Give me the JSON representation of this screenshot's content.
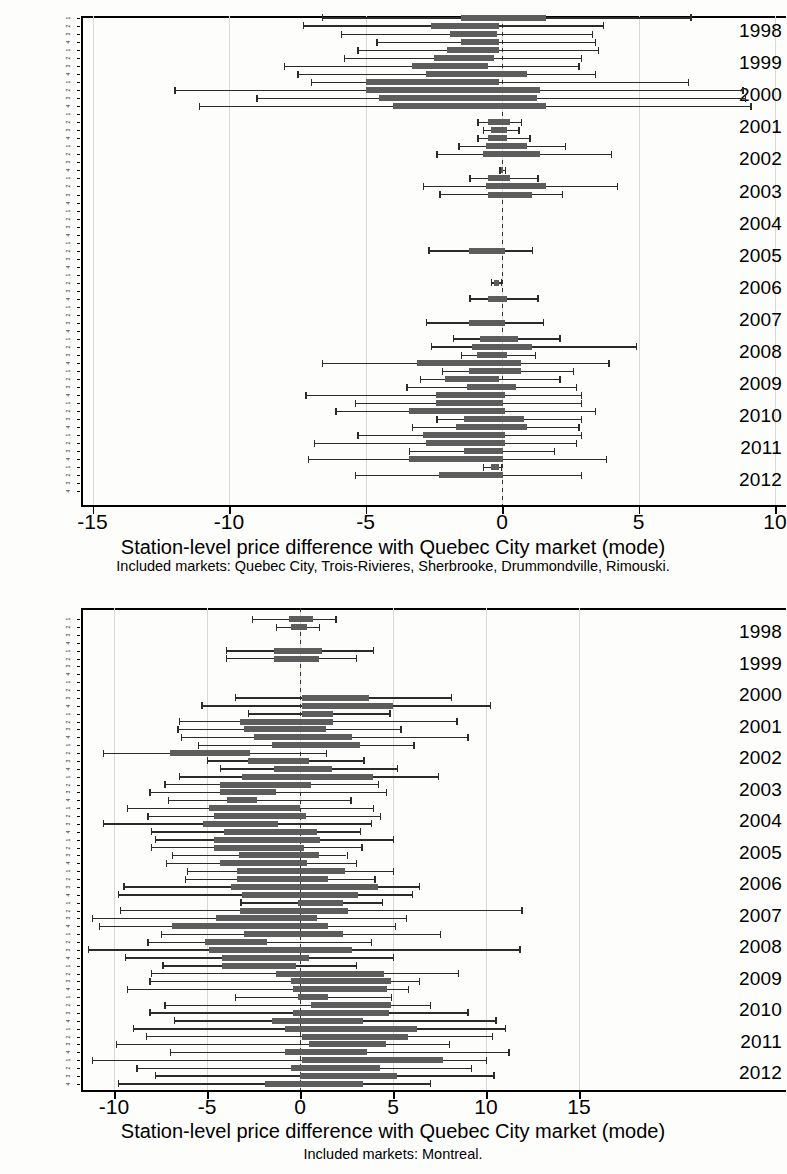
{
  "document": {
    "kind": "scanned-figure-page",
    "figure_count": 2
  },
  "chart_data": [
    {
      "type": "bar",
      "subtype": "horizontal-box-plot",
      "id": "chart-top",
      "title": "",
      "xlabel": "Station-level price difference with Quebec City market (mode)",
      "ylabel": "",
      "caption": "Included markets: Quebec City, Trois-Rivieres, Sherbrooke, Drummondville, Rimouski.",
      "xlim": [
        -16.0,
        10.6
      ],
      "xticks": [
        -15,
        -10,
        -5,
        0,
        5,
        10
      ],
      "xticklabels": [
        "-15",
        "-10",
        "-5",
        "0",
        "5",
        "10"
      ],
      "grid": true,
      "reference_line": 0,
      "legend": "none",
      "years": [
        "1998",
        "1999",
        "2000",
        "2001",
        "2002",
        "2003",
        "2004",
        "2005",
        "2006",
        "2007",
        "2008",
        "2009",
        "2010",
        "2011",
        "2012"
      ],
      "quarter_labels": [
        "1",
        "2",
        "3",
        "4"
      ],
      "boxes": [
        {
          "year": "1998",
          "q": 1,
          "low": -6.6,
          "q1": -1.5,
          "q3": 1.6,
          "high": 6.9
        },
        {
          "year": "1998",
          "q": 2,
          "low": -7.3,
          "q1": -2.6,
          "q3": -0.1,
          "high": 3.7
        },
        {
          "year": "1998",
          "q": 3,
          "low": -5.9,
          "q1": -1.9,
          "q3": -0.2,
          "high": 3.3
        },
        {
          "year": "1998",
          "q": 4,
          "low": -4.6,
          "q1": -1.5,
          "q3": -0.1,
          "high": 3.4
        },
        {
          "year": "1999",
          "q": 1,
          "low": -5.3,
          "q1": -2.0,
          "q3": -0.1,
          "high": 3.5
        },
        {
          "year": "1999",
          "q": 2,
          "low": -5.8,
          "q1": -2.5,
          "q3": -0.3,
          "high": 2.9
        },
        {
          "year": "1999",
          "q": 3,
          "low": -8.0,
          "q1": -3.3,
          "q3": -0.5,
          "high": 2.8
        },
        {
          "year": "1999",
          "q": 4,
          "low": -7.5,
          "q1": -2.8,
          "q3": 0.9,
          "high": 3.4
        },
        {
          "year": "2000",
          "q": 1,
          "low": -7.0,
          "q1": -5.0,
          "q3": -0.1,
          "high": 6.8
        },
        {
          "year": "2000",
          "q": 2,
          "low": -12.0,
          "q1": -5.0,
          "q3": 1.4,
          "high": 8.8
        },
        {
          "year": "2000",
          "q": 3,
          "low": -9.0,
          "q1": -4.5,
          "q3": 1.3,
          "high": 8.9
        },
        {
          "year": "2000",
          "q": 4,
          "low": -11.1,
          "q1": -4.0,
          "q3": 1.6,
          "high": 9.1
        },
        {
          "year": "2001",
          "q": 2,
          "low": -0.9,
          "q1": -0.5,
          "q3": 0.3,
          "high": 0.7
        },
        {
          "year": "2001",
          "q": 3,
          "low": -0.7,
          "q1": -0.4,
          "q3": 0.2,
          "high": 0.6
        },
        {
          "year": "2001",
          "q": 4,
          "low": -0.9,
          "q1": -0.5,
          "q3": 0.2,
          "high": 1.0
        },
        {
          "year": "2002",
          "q": 1,
          "low": -1.6,
          "q1": -0.6,
          "q3": 0.9,
          "high": 2.3
        },
        {
          "year": "2002",
          "q": 2,
          "low": -2.4,
          "q1": -0.7,
          "q3": 1.4,
          "high": 4.0
        },
        {
          "year": "2002",
          "q": 4,
          "low": -0.1,
          "q1": -0.05,
          "q3": 0.05,
          "high": 0.1
        },
        {
          "year": "2003",
          "q": 1,
          "low": -1.2,
          "q1": -0.5,
          "q3": 0.3,
          "high": 1.3
        },
        {
          "year": "2003",
          "q": 2,
          "low": -2.9,
          "q1": -0.6,
          "q3": 1.6,
          "high": 4.2
        },
        {
          "year": "2003",
          "q": 3,
          "low": -2.3,
          "q1": -0.5,
          "q3": 1.1,
          "high": 2.2
        },
        {
          "year": "2005",
          "q": 2,
          "low": -2.7,
          "q1": -1.2,
          "q3": 0.1,
          "high": 1.1
        },
        {
          "year": "2006",
          "q": 2,
          "low": -0.4,
          "q1": -0.3,
          "q3": -0.1,
          "high": -0.05
        },
        {
          "year": "2006",
          "q": 4,
          "low": -1.2,
          "q1": -0.5,
          "q3": 0.2,
          "high": 1.3
        },
        {
          "year": "2007",
          "q": 3,
          "low": -2.8,
          "q1": -1.2,
          "q3": 0.1,
          "high": 1.5
        },
        {
          "year": "2008",
          "q": 1,
          "low": -1.8,
          "q1": -0.8,
          "q3": 0.6,
          "high": 2.1
        },
        {
          "year": "2008",
          "q": 2,
          "low": -2.6,
          "q1": -1.1,
          "q3": 1.1,
          "high": 4.9
        },
        {
          "year": "2008",
          "q": 3,
          "low": -1.5,
          "q1": -0.9,
          "q3": 0.2,
          "high": 1.2
        },
        {
          "year": "2008",
          "q": 4,
          "low": -6.6,
          "q1": -3.1,
          "q3": 0.7,
          "high": 3.9
        },
        {
          "year": "2009",
          "q": 1,
          "low": -2.2,
          "q1": -1.2,
          "q3": 0.7,
          "high": 2.6
        },
        {
          "year": "2009",
          "q": 2,
          "low": -3.0,
          "q1": -2.1,
          "q3": -0.1,
          "high": 2.1
        },
        {
          "year": "2009",
          "q": 3,
          "low": -3.5,
          "q1": -1.3,
          "q3": 0.5,
          "high": 2.7
        },
        {
          "year": "2009",
          "q": 4,
          "low": -7.2,
          "q1": -2.4,
          "q3": 0.1,
          "high": 2.9
        },
        {
          "year": "2010",
          "q": 1,
          "low": -5.4,
          "q1": -2.4,
          "q3": 0.05,
          "high": 2.9
        },
        {
          "year": "2010",
          "q": 2,
          "low": -6.1,
          "q1": -3.4,
          "q3": 0.1,
          "high": 3.4
        },
        {
          "year": "2010",
          "q": 3,
          "low": -2.4,
          "q1": -1.4,
          "q3": 0.8,
          "high": 2.9
        },
        {
          "year": "2010",
          "q": 4,
          "low": -3.3,
          "q1": -1.7,
          "q3": 0.9,
          "high": 2.8
        },
        {
          "year": "2011",
          "q": 1,
          "low": -5.3,
          "q1": -2.9,
          "q3": 0.1,
          "high": 2.9
        },
        {
          "year": "2011",
          "q": 2,
          "low": -6.9,
          "q1": -2.8,
          "q3": 0.1,
          "high": 2.7
        },
        {
          "year": "2011",
          "q": 3,
          "low": -3.4,
          "q1": -1.4,
          "q3": 0.05,
          "high": 1.9
        },
        {
          "year": "2011",
          "q": 4,
          "low": -7.1,
          "q1": -3.4,
          "q3": 0.05,
          "high": 3.8
        },
        {
          "year": "2012",
          "q": 1,
          "low": -0.7,
          "q1": -0.4,
          "q3": -0.1,
          "high": -0.05
        },
        {
          "year": "2012",
          "q": 2,
          "low": -5.4,
          "q1": -2.3,
          "q3": 0.05,
          "high": 2.9
        }
      ]
    },
    {
      "type": "bar",
      "subtype": "horizontal-box-plot",
      "id": "chart-bottom",
      "title": "",
      "xlabel": "Station-level price difference with Quebec City market (mode)",
      "ylabel": "",
      "caption": "Included markets: Montreal.",
      "xlim": [
        -12.3,
        15.6
      ],
      "xticks": [
        -10,
        -5,
        0,
        5,
        10,
        15
      ],
      "xticklabels": [
        "-10",
        "-5",
        "0",
        "5",
        "10",
        "15"
      ],
      "grid": true,
      "reference_line": 0,
      "legend": "none",
      "years": [
        "1998",
        "1999",
        "2000",
        "2001",
        "2002",
        "2003",
        "2004",
        "2005",
        "2006",
        "2007",
        "2008",
        "2009",
        "2010",
        "2011",
        "2012"
      ],
      "quarter_labels": [
        "1",
        "2",
        "3",
        "4"
      ],
      "boxes": [
        {
          "year": "1998",
          "q": 1,
          "low": -2.6,
          "q1": -0.6,
          "q3": 0.7,
          "high": 1.9
        },
        {
          "year": "1998",
          "q": 2,
          "low": -1.3,
          "q1": -0.5,
          "q3": 0.4,
          "high": 1.0
        },
        {
          "year": "1999",
          "q": 1,
          "low": -4.0,
          "q1": -1.4,
          "q3": 1.2,
          "high": 3.9
        },
        {
          "year": "1999",
          "q": 2,
          "low": -4.0,
          "q1": -1.4,
          "q3": 1.0,
          "high": 3.0
        },
        {
          "year": "2000",
          "q": 3,
          "low": -3.5,
          "q1": 0.1,
          "q3": 3.7,
          "high": 8.1
        },
        {
          "year": "2000",
          "q": 4,
          "low": -5.3,
          "q1": 0.1,
          "q3": 5.0,
          "high": 10.2
        },
        {
          "year": "2001",
          "q": 1,
          "low": -2.8,
          "q1": 0.1,
          "q3": 1.8,
          "high": 4.8
        },
        {
          "year": "2001",
          "q": 2,
          "low": -6.5,
          "q1": -3.2,
          "q3": 1.8,
          "high": 8.4
        },
        {
          "year": "2001",
          "q": 3,
          "low": -6.6,
          "q1": -3.0,
          "q3": 1.4,
          "high": 5.4
        },
        {
          "year": "2001",
          "q": 4,
          "low": -6.4,
          "q1": -2.5,
          "q3": 2.8,
          "high": 9.0
        },
        {
          "year": "2002",
          "q": 1,
          "low": -5.5,
          "q1": -1.5,
          "q3": 3.2,
          "high": 6.1
        },
        {
          "year": "2002",
          "q": 2,
          "low": -10.6,
          "q1": -7.0,
          "q3": -2.7,
          "high": 1.4
        },
        {
          "year": "2002",
          "q": 3,
          "low": -5.0,
          "q1": -2.8,
          "q3": 0.5,
          "high": 3.4
        },
        {
          "year": "2002",
          "q": 4,
          "low": -4.3,
          "q1": -1.4,
          "q3": 1.7,
          "high": 5.2
        },
        {
          "year": "2003",
          "q": 1,
          "low": -6.5,
          "q1": -3.1,
          "q3": 3.9,
          "high": 7.4
        },
        {
          "year": "2003",
          "q": 2,
          "low": -7.3,
          "q1": -4.3,
          "q3": 0.6,
          "high": 4.2
        },
        {
          "year": "2003",
          "q": 3,
          "low": -8.1,
          "q1": -4.3,
          "q3": -1.3,
          "high": 4.6
        },
        {
          "year": "2003",
          "q": 4,
          "low": -7.1,
          "q1": -3.9,
          "q3": -2.3,
          "high": 2.7
        },
        {
          "year": "2004",
          "q": 1,
          "low": -9.3,
          "q1": -4.9,
          "q3": 0.0,
          "high": 3.9
        },
        {
          "year": "2004",
          "q": 2,
          "low": -8.2,
          "q1": -4.6,
          "q3": 0.3,
          "high": 4.3
        },
        {
          "year": "2004",
          "q": 3,
          "low": -10.6,
          "q1": -5.2,
          "q3": -1.2,
          "high": 3.8
        },
        {
          "year": "2004",
          "q": 4,
          "low": -8.0,
          "q1": -4.1,
          "q3": 0.9,
          "high": 3.2
        },
        {
          "year": "2005",
          "q": 1,
          "low": -7.8,
          "q1": -4.6,
          "q3": 1.1,
          "high": 5.0
        },
        {
          "year": "2005",
          "q": 2,
          "low": -8.0,
          "q1": -4.6,
          "q3": 0.2,
          "high": 3.3
        },
        {
          "year": "2005",
          "q": 3,
          "low": -6.9,
          "q1": -3.3,
          "q3": 1.0,
          "high": 2.5
        },
        {
          "year": "2005",
          "q": 4,
          "low": -7.2,
          "q1": -4.3,
          "q3": 0.4,
          "high": 3.0
        },
        {
          "year": "2006",
          "q": 1,
          "low": -6.1,
          "q1": -3.4,
          "q3": 2.4,
          "high": 5.0
        },
        {
          "year": "2006",
          "q": 2,
          "low": -6.2,
          "q1": -3.4,
          "q3": 1.5,
          "high": 4.0
        },
        {
          "year": "2006",
          "q": 3,
          "low": -9.5,
          "q1": -3.7,
          "q3": 4.2,
          "high": 6.4
        },
        {
          "year": "2006",
          "q": 4,
          "low": -9.8,
          "q1": -3.1,
          "q3": 3.1,
          "high": 6.0
        },
        {
          "year": "2007",
          "q": 1,
          "low": -3.2,
          "q1": -0.1,
          "q3": 2.3,
          "high": 4.4
        },
        {
          "year": "2007",
          "q": 2,
          "low": -9.7,
          "q1": -3.2,
          "q3": 2.6,
          "high": 11.9
        },
        {
          "year": "2007",
          "q": 3,
          "low": -11.2,
          "q1": -4.5,
          "q3": 0.9,
          "high": 5.7
        },
        {
          "year": "2007",
          "q": 4,
          "low": -10.8,
          "q1": -6.9,
          "q3": 1.5,
          "high": 5.1
        },
        {
          "year": "2008",
          "q": 1,
          "low": -7.5,
          "q1": -3.0,
          "q3": 2.3,
          "high": 7.5
        },
        {
          "year": "2008",
          "q": 2,
          "low": -8.2,
          "q1": -5.1,
          "q3": -1.8,
          "high": 3.8
        },
        {
          "year": "2008",
          "q": 3,
          "low": -11.4,
          "q1": -4.9,
          "q3": 2.8,
          "high": 11.8
        },
        {
          "year": "2008",
          "q": 4,
          "low": -9.4,
          "q1": -4.2,
          "q3": 0.5,
          "high": 5.0
        },
        {
          "year": "2009",
          "q": 1,
          "low": -7.4,
          "q1": -4.2,
          "q3": -0.2,
          "high": 3.0
        },
        {
          "year": "2009",
          "q": 2,
          "low": -8.0,
          "q1": -1.3,
          "q3": 4.5,
          "high": 8.5
        },
        {
          "year": "2009",
          "q": 3,
          "low": -8.1,
          "q1": -0.5,
          "q3": 4.9,
          "high": 6.4
        },
        {
          "year": "2009",
          "q": 4,
          "low": -9.3,
          "q1": -0.4,
          "q3": 4.7,
          "high": 5.8
        },
        {
          "year": "2010",
          "q": 1,
          "low": -3.5,
          "q1": -0.1,
          "q3": 1.5,
          "high": 4.9
        },
        {
          "year": "2010",
          "q": 2,
          "low": -7.3,
          "q1": 0.6,
          "q3": 4.9,
          "high": 7.0
        },
        {
          "year": "2010",
          "q": 3,
          "low": -8.1,
          "q1": -0.4,
          "q3": 4.8,
          "high": 9.0
        },
        {
          "year": "2010",
          "q": 4,
          "low": -6.8,
          "q1": -1.5,
          "q3": 3.4,
          "high": 10.5
        },
        {
          "year": "2011",
          "q": 1,
          "low": -9.0,
          "q1": -0.8,
          "q3": 6.3,
          "high": 11.0
        },
        {
          "year": "2011",
          "q": 2,
          "low": -8.3,
          "q1": 0.1,
          "q3": 5.8,
          "high": 10.3
        },
        {
          "year": "2011",
          "q": 3,
          "low": -9.9,
          "q1": 0.5,
          "q3": 4.6,
          "high": 8.0
        },
        {
          "year": "2011",
          "q": 4,
          "low": -7.0,
          "q1": -0.8,
          "q3": 3.6,
          "high": 11.2
        },
        {
          "year": "2012",
          "q": 1,
          "low": -11.2,
          "q1": 0.1,
          "q3": 7.7,
          "high": 10.0
        },
        {
          "year": "2012",
          "q": 2,
          "low": -8.8,
          "q1": -0.5,
          "q3": 4.3,
          "high": 9.2
        },
        {
          "year": "2012",
          "q": 3,
          "low": -7.8,
          "q1": 0.0,
          "q3": 5.2,
          "high": 10.4
        },
        {
          "year": "2012",
          "q": 4,
          "low": -9.8,
          "q1": -1.9,
          "q3": 3.4,
          "high": 7.0
        }
      ]
    }
  ]
}
